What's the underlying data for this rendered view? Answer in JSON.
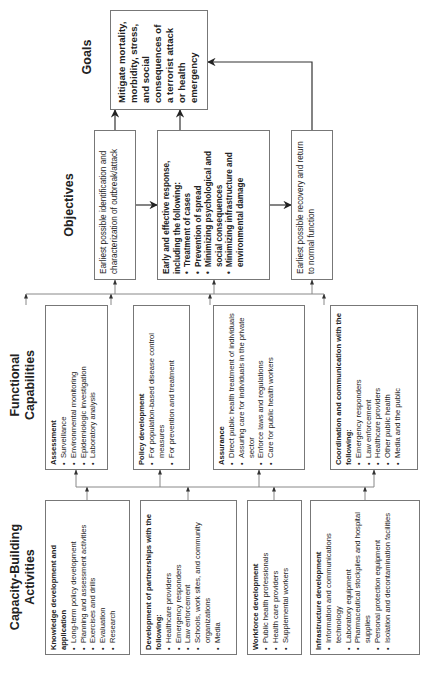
{
  "headers": {
    "capacity": "Capacity-Building Activities",
    "functional": "Functional Capabilities",
    "objectives": "Objectives",
    "goals": "Goals"
  },
  "goal": {
    "text": "Mitigate mortality, morbidity, stress, and social consequences of a terrorist attack or health emergency"
  },
  "objectives": [
    {
      "text": "Earliest possible identification and characterization of outbreak/attack",
      "items": []
    },
    {
      "text": "Early and effective response, including the following:",
      "items": [
        "Treatment of cases",
        "Prevention of spread",
        "Minimizing psychological and social consequences",
        "Minimizing infrastructure and environmental damage"
      ]
    },
    {
      "text": "Earliest possible recovery and return to normal function",
      "items": []
    }
  ],
  "functional": [
    {
      "title": "Assessment",
      "items": [
        "Surveillance",
        "Environmental monitoring",
        "Epidemiologic investigation",
        "Laboratory analysis"
      ]
    },
    {
      "title": "Policy development",
      "items": [
        "For population-based disease control measures",
        "For prevention and treatment"
      ]
    },
    {
      "title": "Assurance",
      "items": [
        "Direct public health treatment of individuals",
        "Assuring care for individuals in the private sector",
        "Enforce laws and regulations",
        "Care for public health workers"
      ]
    },
    {
      "title": "Coordination and communication with the following:",
      "items": [
        "Emergency responders",
        "Law enforcement",
        "Healthcare providers",
        "Other public health",
        "Media and the public"
      ]
    }
  ],
  "capacity": [
    {
      "title": "Knowledge development and application",
      "items": [
        "Long-term policy development",
        "Planning and assessment activities",
        "Exercises and drills",
        "Evaluation",
        "Research"
      ]
    },
    {
      "title": "Development of partnerships with the following:",
      "items": [
        "Healthcare providers",
        "Emergency responders",
        "Law enforcement",
        "Schools, work sites, and community organizations",
        "Media"
      ]
    },
    {
      "title": "Workforce development",
      "items": [
        "Public health professionals",
        "Health care providers",
        "Supplemental workers"
      ]
    },
    {
      "title": "Infrastructure development",
      "items": [
        "Information and communications technology",
        "Laboratory equipment",
        "Pharmaceutical stockpiles and hospital supplies",
        "Personal protection equipment",
        "Isolation and decontamination facilities"
      ]
    }
  ]
}
